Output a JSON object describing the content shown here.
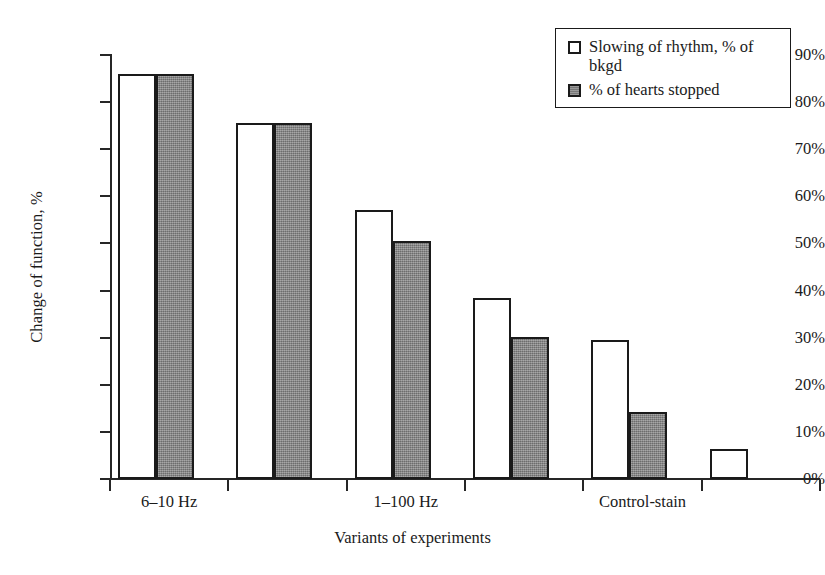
{
  "chart_data": {
    "type": "bar",
    "title": "",
    "xlabel": "Variants of experiments",
    "ylabel": "Change of function, %",
    "ylim": [
      0,
      90
    ],
    "ytick_labels": [
      "0%",
      "10%",
      "20%",
      "30%",
      "40%",
      "50%",
      "60%",
      "70%",
      "80%",
      "90%"
    ],
    "ytick_values": [
      0,
      10,
      20,
      30,
      40,
      50,
      60,
      70,
      80,
      90
    ],
    "grid": false,
    "legend_position": "top-right",
    "categories": [
      "6–10 Hz",
      "",
      "1–100 Hz",
      "",
      "Control-stain",
      ""
    ],
    "visible_category_labels": [
      "6–10 Hz",
      "1–100 Hz",
      "Control-stain"
    ],
    "group_count": 6,
    "series": [
      {
        "name": "Slowing of rhythm, % of bkgd",
        "swatch": "white",
        "values": [
          86.0,
          75.5,
          57.0,
          38.5,
          29.5,
          6.3
        ]
      },
      {
        "name": "% of hearts stopped",
        "swatch": "gray",
        "values": [
          86.0,
          75.5,
          50.5,
          30.2,
          14.3,
          null
        ]
      }
    ]
  },
  "legend": {
    "items": [
      {
        "label": "Slowing of rhythm, % of bkgd",
        "swatch": "white"
      },
      {
        "label": "% of hearts stopped",
        "swatch": "gray"
      }
    ]
  },
  "axes": {
    "y_title": "Change of function, %",
    "x_title": "Variants of experiments",
    "y_ticks": [
      "90%",
      "80%",
      "70%",
      "60%",
      "50%",
      "40%",
      "30%",
      "20%",
      "10%",
      "0%"
    ],
    "x_labels": [
      "6–10 Hz",
      "1–100 Hz",
      "Control-stain"
    ]
  },
  "colors": {
    "axis": "#262626",
    "bar_outline": "#1a1a1a",
    "bar_white_fill": "#ffffff",
    "bar_gray_fill": "#858585",
    "background": "#ffffff"
  }
}
